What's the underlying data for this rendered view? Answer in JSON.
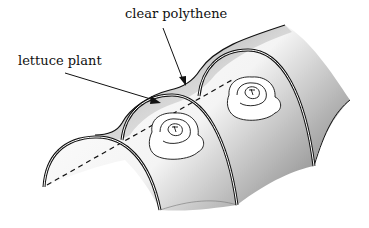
{
  "diagram": {
    "labels": {
      "polythene": "clear polythene",
      "lettuce": "lettuce plant"
    },
    "colors": {
      "line": "#111111",
      "shade_dark": "#8a8a8a",
      "shade_light": "#ffffff"
    }
  }
}
